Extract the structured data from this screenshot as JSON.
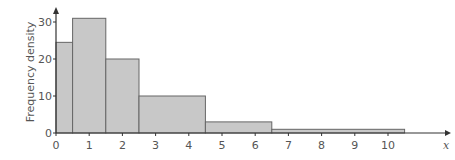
{
  "chart_data": {
    "type": "bar",
    "subtype": "histogram",
    "title": "",
    "xlabel": "x",
    "ylabel": "Frequency density",
    "bins": [
      {
        "start": 0,
        "end": 0.5,
        "frequency_density": 24.5
      },
      {
        "start": 0.5,
        "end": 1.5,
        "frequency_density": 31
      },
      {
        "start": 1.5,
        "end": 2.5,
        "frequency_density": 20
      },
      {
        "start": 2.5,
        "end": 4.5,
        "frequency_density": 10
      },
      {
        "start": 4.5,
        "end": 6.5,
        "frequency_density": 3
      },
      {
        "start": 6.5,
        "end": 10.5,
        "frequency_density": 1
      }
    ],
    "x_ticks": [
      "0",
      "1",
      "2",
      "3",
      "4",
      "5",
      "6",
      "7",
      "8",
      "9",
      "10"
    ],
    "y_ticks": [
      "0",
      "10",
      "20",
      "30"
    ],
    "xlim": [
      0,
      11
    ],
    "ylim": [
      0,
      34
    ],
    "grid": false,
    "bar_color": "#c8c8c8",
    "edge_color": "#666666"
  }
}
